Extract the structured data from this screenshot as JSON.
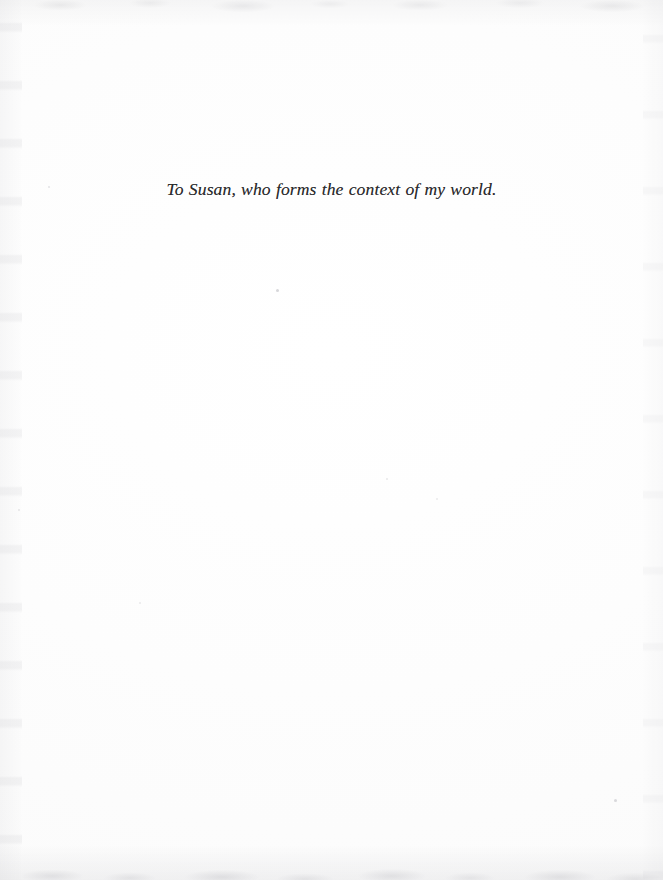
{
  "page": {
    "kind": "book-dedication-page",
    "background_color": "#fcfcfc",
    "text_color": "#2a2a2c"
  },
  "dedication": {
    "text": "To Susan, who forms the context of my world."
  }
}
